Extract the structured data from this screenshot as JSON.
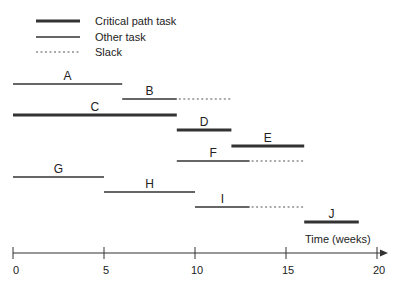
{
  "legend": {
    "items": [
      {
        "label": "Critical path task",
        "style": "critical"
      },
      {
        "label": "Other task",
        "style": "other"
      },
      {
        "label": "Slack",
        "style": "slack"
      }
    ]
  },
  "axis": {
    "label": "Time (weeks)",
    "ticks": [
      "0",
      "5",
      "10",
      "15",
      "20"
    ],
    "min": 0,
    "max": 20
  },
  "tasks": [
    {
      "name": "A",
      "start": 0,
      "end": 6,
      "critical": false,
      "slack_end": null
    },
    {
      "name": "B",
      "start": 6,
      "end": 9,
      "critical": false,
      "slack_end": 12
    },
    {
      "name": "C",
      "start": 0,
      "end": 9,
      "critical": true,
      "slack_end": null
    },
    {
      "name": "D",
      "start": 9,
      "end": 12,
      "critical": true,
      "slack_end": null
    },
    {
      "name": "E",
      "start": 12,
      "end": 16,
      "critical": true,
      "slack_end": null
    },
    {
      "name": "F",
      "start": 9,
      "end": 13,
      "critical": false,
      "slack_end": 16
    },
    {
      "name": "G",
      "start": 0,
      "end": 5,
      "critical": false,
      "slack_end": null
    },
    {
      "name": "H",
      "start": 5,
      "end": 10,
      "critical": false,
      "slack_end": null
    },
    {
      "name": "I",
      "start": 10,
      "end": 13,
      "critical": false,
      "slack_end": 16
    },
    {
      "name": "J",
      "start": 16,
      "end": 19,
      "critical": true,
      "slack_end": null
    }
  ],
  "colors": {
    "line": "#333333",
    "text": "#222222"
  }
}
